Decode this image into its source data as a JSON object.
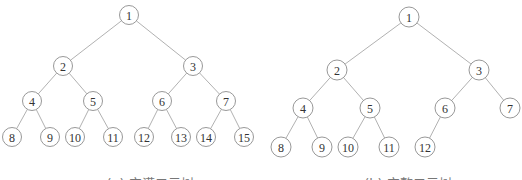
{
  "figures": [
    {
      "id": "full",
      "caption": "(a) 完满二元树",
      "caption_pos": [
        150,
        188
      ],
      "radius": 9.5,
      "nodes": [
        {
          "label": "1",
          "x": 129,
          "y": 15
        },
        {
          "label": "2",
          "x": 63,
          "y": 66
        },
        {
          "label": "3",
          "x": 193,
          "y": 66
        },
        {
          "label": "4",
          "x": 32,
          "y": 101
        },
        {
          "label": "5",
          "x": 93,
          "y": 101
        },
        {
          "label": "6",
          "x": 162,
          "y": 101
        },
        {
          "label": "7",
          "x": 226,
          "y": 101
        },
        {
          "label": "8",
          "x": 12,
          "y": 137
        },
        {
          "label": "9",
          "x": 50,
          "y": 137
        },
        {
          "label": "10",
          "x": 75,
          "y": 137
        },
        {
          "label": "11",
          "x": 113,
          "y": 137
        },
        {
          "label": "12",
          "x": 144,
          "y": 137
        },
        {
          "label": "13",
          "x": 181,
          "y": 137
        },
        {
          "label": "14",
          "x": 206,
          "y": 137
        },
        {
          "label": "15",
          "x": 244,
          "y": 137
        }
      ]
    },
    {
      "id": "complete",
      "caption": "(b) 完整二元树",
      "caption_pos": [
        408,
        188
      ],
      "radius": 10,
      "nodes": [
        {
          "label": "1",
          "x": 409,
          "y": 17
        },
        {
          "label": "2",
          "x": 337,
          "y": 70
        },
        {
          "label": "3",
          "x": 479,
          "y": 70
        },
        {
          "label": "4",
          "x": 303,
          "y": 108
        },
        {
          "label": "5",
          "x": 370,
          "y": 108
        },
        {
          "label": "6",
          "x": 445,
          "y": 108
        },
        {
          "label": "7",
          "x": 510,
          "y": 108
        },
        {
          "label": "8",
          "x": 281,
          "y": 147
        },
        {
          "label": "9",
          "x": 322,
          "y": 147
        },
        {
          "label": "10",
          "x": 348,
          "y": 147
        },
        {
          "label": "11",
          "x": 389,
          "y": 147
        },
        {
          "label": "12",
          "x": 425,
          "y": 147
        }
      ]
    }
  ]
}
